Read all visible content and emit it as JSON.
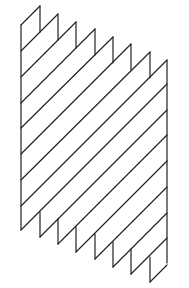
{
  "figure": {
    "stroke_color": "#222222",
    "background": "#ffffff",
    "left_edge": {
      "x": 21,
      "y1": 25,
      "y2": 230
    },
    "right_edge": {
      "x": 167,
      "y1": 60,
      "y2": 263
    },
    "top_peaks": [
      [
        40,
        6
      ],
      [
        58,
        14
      ],
      [
        76,
        22
      ],
      [
        95,
        29
      ],
      [
        113,
        37
      ],
      [
        131,
        44
      ],
      [
        150,
        52
      ],
      [
        167,
        60
      ]
    ],
    "bottom_teeth": [
      [
        21,
        230
      ],
      [
        40,
        237
      ],
      [
        58,
        244
      ],
      [
        76,
        252
      ],
      [
        95,
        259
      ],
      [
        113,
        267
      ],
      [
        131,
        274
      ],
      [
        150,
        282
      ]
    ],
    "left_edge_line_starts": [
      25,
      51,
      77,
      103,
      128,
      154,
      180,
      206,
      230
    ],
    "notch_depth": 26,
    "stripe_slope": -1
  }
}
